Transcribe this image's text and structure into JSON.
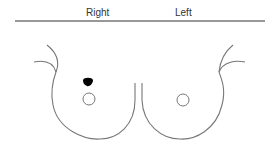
{
  "diagram": {
    "type": "anatomical-breast-diagram",
    "labels": {
      "right": "Right",
      "left": "Left"
    },
    "colors": {
      "outline": "#777777",
      "header_line": "#333333",
      "lesion_marker": "#000000",
      "text": "#333333"
    },
    "markers": [
      {
        "side": "right",
        "kind": "lesion",
        "position": "upper-outer, above nipple"
      }
    ]
  }
}
